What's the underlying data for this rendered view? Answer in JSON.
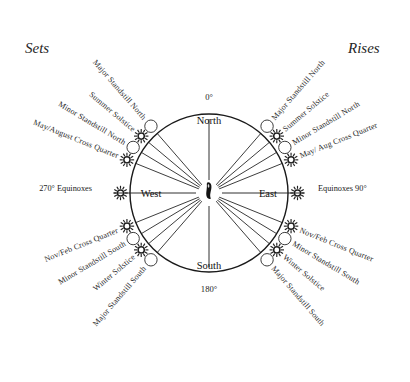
{
  "diagram": {
    "title_left": "Sets",
    "title_right": "Rises",
    "center_marker": "standing-stone",
    "cardinals": [
      {
        "name": "north",
        "label": "North",
        "x": 209,
        "y": 120
      },
      {
        "name": "south",
        "label": "South",
        "x": 209,
        "y": 265
      },
      {
        "name": "west",
        "label": "West",
        "x": 151,
        "y": 193
      },
      {
        "name": "east",
        "label": "East",
        "x": 268,
        "y": 193
      }
    ],
    "degrees": [
      {
        "name": "degree-0",
        "label": "0°",
        "x": 209,
        "y": 97
      },
      {
        "name": "degree-180",
        "label": "180°",
        "x": 209,
        "y": 289
      },
      {
        "name": "degree-270",
        "label": "270° Equinoxes",
        "side": "left"
      },
      {
        "name": "degree-90",
        "label": "Equinoxes 90°",
        "side": "right"
      }
    ],
    "circle": {
      "cx": 209,
      "cy": 193,
      "r": 79,
      "stroke": "#1a1a1a"
    },
    "rays": [
      {
        "azimuth": 41,
        "marker": "moon"
      },
      {
        "azimuth": 50,
        "marker": "sun"
      },
      {
        "azimuth": 59,
        "marker": "moon"
      },
      {
        "azimuth": 68,
        "marker": "sun"
      },
      {
        "azimuth": 112,
        "marker": "sun"
      },
      {
        "azimuth": 121,
        "marker": "moon"
      },
      {
        "azimuth": 130,
        "marker": "sun"
      },
      {
        "azimuth": 139,
        "marker": "moon"
      },
      {
        "azimuth": 221,
        "marker": "moon"
      },
      {
        "azimuth": 230,
        "marker": "sun"
      },
      {
        "azimuth": 239,
        "marker": "moon"
      },
      {
        "azimuth": 248,
        "marker": "sun"
      },
      {
        "azimuth": 292,
        "marker": "sun"
      },
      {
        "azimuth": 301,
        "marker": "moon"
      },
      {
        "azimuth": 310,
        "marker": "sun"
      },
      {
        "azimuth": 319,
        "marker": "moon"
      }
    ],
    "ray_labels": [
      {
        "name": "label-major-standstill-north-rise",
        "text": "Major Standstill North",
        "azimuth": 41,
        "side": "rises"
      },
      {
        "name": "label-summer-solstice-rise",
        "text": "Summer Solstice",
        "azimuth": 50,
        "side": "rises"
      },
      {
        "name": "label-minor-standstill-north-rise",
        "text": "Minor Standstill North",
        "azimuth": 59,
        "side": "rises"
      },
      {
        "name": "label-may-aug-cross-quarter-rise",
        "text": "May/ Aug Cross Quarter",
        "azimuth": 68,
        "side": "rises"
      },
      {
        "name": "label-nov-feb-cross-quarter-rise",
        "text": "Nov/Feb Cross Quarter",
        "azimuth": 112,
        "side": "rises"
      },
      {
        "name": "label-minor-standstill-south-rise",
        "text": "Minor Standstill South",
        "azimuth": 121,
        "side": "rises"
      },
      {
        "name": "label-winter-solstice-rise",
        "text": "Winter Solstice",
        "azimuth": 130,
        "side": "rises"
      },
      {
        "name": "label-major-standstill-south-rise",
        "text": "Major Standstill South",
        "azimuth": 139,
        "side": "rises"
      },
      {
        "name": "label-major-standstill-south-set",
        "text": "Major Standstill South",
        "azimuth": 221,
        "side": "sets"
      },
      {
        "name": "label-winter-solstice-set",
        "text": "Winter Solstice",
        "azimuth": 230,
        "side": "sets"
      },
      {
        "name": "label-minor-standstill-south-set",
        "text": "Minor Standstill South",
        "azimuth": 239,
        "side": "sets"
      },
      {
        "name": "label-nov-feb-cross-quarter-set",
        "text": "Nov/Feb Cross Quarter",
        "azimuth": 248,
        "side": "sets"
      },
      {
        "name": "label-may-august-cross-quarter-set",
        "text": "May/August Cross Quarter",
        "azimuth": 292,
        "side": "sets"
      },
      {
        "name": "label-minor-standstill-north-set",
        "text": "Minor Standstill North",
        "azimuth": 301,
        "side": "sets"
      },
      {
        "name": "label-summer-solstice-set",
        "text": "Summer Solstice",
        "azimuth": 310,
        "side": "sets"
      },
      {
        "name": "label-major-standstill-north-set",
        "text": "Major Standstill North",
        "azimuth": 319,
        "side": "sets"
      }
    ],
    "colors": {
      "ink": "#1a1a1a",
      "background": "#ffffff",
      "sun_marker": "#1f1f1f",
      "moon_marker": "#3d3d3d"
    }
  }
}
